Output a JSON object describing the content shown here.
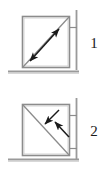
{
  "figure": {
    "background_color": "#ffffff",
    "line_color": "#7a7a7a",
    "arrow_color": "#1a1a1a",
    "ground_color": "#8a8a8a",
    "label_color": "#1a1a1a"
  },
  "panels": [
    {
      "id": "panel-1",
      "label": "1",
      "description": "Square block with diagonal line from bottom-left to top-right and a double-headed arrow parallel to the diagonal",
      "box": {
        "x": 22,
        "y": 16,
        "width": 48,
        "height": 52
      },
      "diagonal": {
        "x1": 22,
        "y1": 68,
        "x2": 70,
        "y2": 16
      },
      "arrow": {
        "type": "double-headed",
        "x1": 30,
        "y1": 60,
        "x2": 58,
        "y2": 29,
        "direction": "bidirectional-along-diagonal"
      },
      "wall": {
        "x": 76,
        "y1": 10,
        "y2": 70
      },
      "tick_marks": [
        {
          "x1": 70,
          "x2": 78,
          "y": 27
        }
      ],
      "ground": {
        "x1": 8,
        "x2": 80,
        "y": 72
      }
    },
    {
      "id": "panel-2",
      "label": "2",
      "description": "Square block with diagonal line from top-left to bottom-right and two short arrows pointing down-left toward the diagonal",
      "box": {
        "x": 22,
        "y": 104,
        "width": 48,
        "height": 52
      },
      "diagonal": {
        "x1": 22,
        "y1": 104,
        "x2": 70,
        "y2": 156
      },
      "arrows": [
        {
          "type": "single-headed",
          "x1": 58,
          "y1": 110,
          "x2": 44,
          "y2": 124,
          "direction": "down-left"
        },
        {
          "type": "single-headed",
          "x1": 68,
          "y1": 136,
          "x2": 54,
          "y2": 122,
          "direction": "up-left"
        }
      ],
      "wall": {
        "x": 76,
        "y1": 98,
        "y2": 160
      },
      "tick_marks": [
        {
          "x1": 70,
          "x2": 78,
          "y": 115
        },
        {
          "x1": 70,
          "x2": 78,
          "y": 148
        }
      ],
      "ground": {
        "x1": 8,
        "x2": 80,
        "y": 160
      }
    }
  ]
}
